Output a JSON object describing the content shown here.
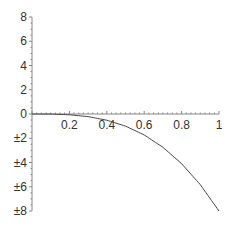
{
  "chart_data": {
    "type": "line",
    "title": "",
    "xlabel": "",
    "ylabel": "",
    "xlim": [
      0,
      1
    ],
    "ylim": [
      -8,
      8
    ],
    "grid": false,
    "legend": null,
    "x_ticks": [
      "0.2",
      "0.4",
      "0.6",
      "0.8",
      "1"
    ],
    "y_ticks": [
      "8",
      "6",
      "4",
      "2",
      "0",
      "±2",
      "±4",
      "±6",
      "±8"
    ],
    "series": [
      {
        "name": "f(x)",
        "color": "#444444",
        "x": [
          0,
          0.1,
          0.2,
          0.3,
          0.4,
          0.5,
          0.6,
          0.7,
          0.8,
          0.9,
          1.0
        ],
        "y": [
          0,
          -0.008,
          -0.064,
          -0.216,
          -0.512,
          -1.0,
          -1.728,
          -2.744,
          -4.096,
          -5.832,
          -8.0
        ]
      }
    ]
  }
}
